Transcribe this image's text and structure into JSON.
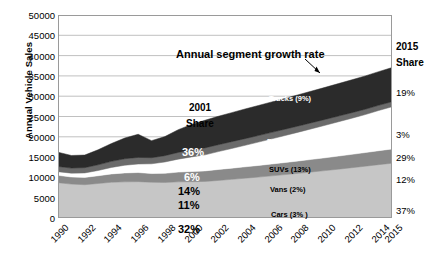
{
  "chart_data": {
    "type": "area",
    "title": "",
    "xlabel": "",
    "ylabel": "Annual Vehicle Sales",
    "ylim": [
      0,
      50000
    ],
    "ytick_values": [
      0,
      5000,
      10000,
      15000,
      20000,
      25000,
      30000,
      35000,
      40000,
      45000,
      50000
    ],
    "ytick_labels": [
      "0",
      "5000",
      "10000",
      "15000",
      "20000",
      "25000",
      "30000",
      "35000",
      "40000",
      "45000",
      "50000"
    ],
    "xlim": [
      1990,
      2015
    ],
    "xtick_values": [
      1990,
      1992,
      1994,
      1996,
      1998,
      2000,
      2002,
      2004,
      2006,
      2008,
      2010,
      2012,
      2014,
      2015
    ],
    "xtick_labels": [
      "1990",
      "1992",
      "1994",
      "1996",
      "1998",
      "2000",
      "2002",
      "2004",
      "2006",
      "2008",
      "2010",
      "2012",
      "2014",
      "2015"
    ],
    "grid": true,
    "legend": "inline-labels",
    "stacking": "stacked-area-bottom-to-top",
    "x": [
      1990,
      1991,
      1992,
      1993,
      1994,
      1995,
      1996,
      1997,
      1998,
      1999,
      2000,
      2001,
      2002,
      2003,
      2004,
      2005,
      2006,
      2007,
      2008,
      2009,
      2010,
      2011,
      2012,
      2013,
      2014,
      2015
    ],
    "series": [
      {
        "name": "Cars",
        "growth_label": "Cars (3% )",
        "growth_rate_pct": 3,
        "share_2001_pct": "32%",
        "share_2015_pct": "37%",
        "color": "#c6c6c6",
        "text_color": "#000000",
        "values": [
          8700,
          8350,
          8200,
          8500,
          8800,
          8900,
          8950,
          8800,
          8750,
          8900,
          8950,
          9000,
          9250,
          9520,
          9800,
          10080,
          10380,
          10690,
          11010,
          11340,
          11680,
          12030,
          12390,
          12760,
          13140,
          13500
        ]
      },
      {
        "name": "Vans",
        "growth_label": "Vans (2%)",
        "growth_rate_pct": 2,
        "share_2001_pct": "11%",
        "share_2015_pct": "12%",
        "color": "#8a8a8a",
        "text_color": "#000000",
        "values": [
          1800,
          1750,
          1800,
          1900,
          2050,
          2200,
          2250,
          2150,
          2250,
          2400,
          2500,
          2600,
          2700,
          2750,
          2800,
          2860,
          2920,
          2980,
          3040,
          3100,
          3160,
          3230,
          3290,
          3360,
          3430,
          3500
        ]
      },
      {
        "name": "SUVs",
        "growth_label": "SUVs (13%)",
        "growth_rate_pct": 13,
        "share_2001_pct": "14%",
        "share_2015_pct": "29%",
        "color": "#ffffff",
        "text_color": "#000000",
        "values": [
          900,
          950,
          1100,
          1300,
          1600,
          1900,
          2100,
          2400,
          2800,
          3200,
          3600,
          3950,
          4400,
          4850,
          5300,
          5750,
          6200,
          6650,
          7100,
          7550,
          8000,
          8450,
          8900,
          9350,
          9900,
          10400
        ]
      },
      {
        "name": "Pickups",
        "growth_label": "Pickups (8%)",
        "growth_rate_pct": 8,
        "share_2001_pct": "6%",
        "share_2015_pct": "3%",
        "color": "#6b6b6b",
        "text_color": "#ffffff",
        "values": [
          1300,
          1250,
          1300,
          1400,
          1500,
          1600,
          1620,
          1500,
          1550,
          1650,
          1700,
          1720,
          1700,
          1680,
          1650,
          1620,
          1590,
          1560,
          1520,
          1480,
          1440,
          1400,
          1360,
          1320,
          1280,
          1250
        ]
      },
      {
        "name": "Trucks",
        "growth_label": "Trucks (9%)",
        "growth_rate_pct": 9,
        "share_2001_pct": "36%",
        "share_2015_pct": "19%",
        "color": "#2b2b2b",
        "text_color": "#ffffff",
        "values": [
          3500,
          3100,
          3100,
          3700,
          4400,
          5100,
          5700,
          4200,
          4700,
          5600,
          6300,
          6800,
          7000,
          7150,
          7300,
          7400,
          7500,
          7600,
          7700,
          7800,
          7900,
          8000,
          8100,
          8200,
          8300,
          8400
        ]
      }
    ],
    "annotations": [
      {
        "name": "growth-rate-callout",
        "text": "Annual segment growth rate",
        "points_to": "Trucks band"
      },
      {
        "name": "share-2001-header",
        "line1": "2001",
        "line2": "Share"
      },
      {
        "name": "share-2015-header",
        "line1": "2015",
        "line2": "Share"
      }
    ]
  }
}
